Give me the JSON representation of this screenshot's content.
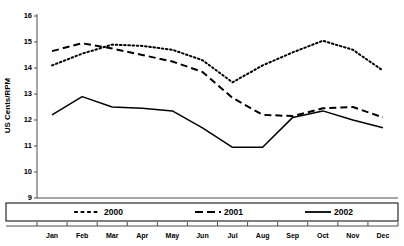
{
  "chart_data": {
    "type": "line",
    "title": "",
    "xlabel": "",
    "ylabel": "US Cents/RPM",
    "categories": [
      "Jan",
      "Feb",
      "Mar",
      "Apr",
      "May",
      "Jun",
      "Jul",
      "Aug",
      "Sep",
      "Oct",
      "Nov",
      "Dec"
    ],
    "ylim": [
      9,
      16
    ],
    "yticks": [
      9,
      10,
      11,
      12,
      13,
      14,
      15,
      16
    ],
    "ytick_labels": [
      "9",
      "10",
      "11",
      "12",
      "13",
      "14",
      "15",
      "16"
    ],
    "grid": false,
    "legend_position": "bottom",
    "series": [
      {
        "name": "2000",
        "style": "dotted",
        "color": "#000000",
        "values": [
          14.1,
          14.55,
          14.9,
          14.85,
          14.7,
          14.3,
          13.45,
          14.1,
          14.6,
          15.05,
          14.7,
          13.9
        ]
      },
      {
        "name": "2001",
        "style": "dashed",
        "color": "#000000",
        "values": [
          14.65,
          14.95,
          14.75,
          14.5,
          14.25,
          13.85,
          12.85,
          12.2,
          12.15,
          12.45,
          12.5,
          12.1
        ]
      },
      {
        "name": "2002",
        "style": "solid",
        "color": "#000000",
        "values": [
          12.2,
          12.9,
          12.5,
          12.45,
          12.35,
          11.7,
          10.95,
          10.95,
          12.1,
          12.35,
          12.0,
          11.7
        ]
      }
    ]
  },
  "legend": {
    "items": [
      {
        "label": "2000",
        "style": "dotted"
      },
      {
        "label": "2001",
        "style": "dashed"
      },
      {
        "label": "2002",
        "style": "solid"
      }
    ]
  }
}
